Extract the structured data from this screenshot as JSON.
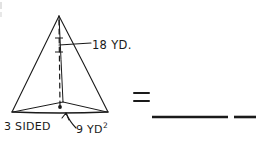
{
  "worksheet": {
    "figure": {
      "shape_name": "triangular-pyramid",
      "height_label": "18 YD.",
      "base_sides_label": "3 SIDED",
      "base_area_label_number": "9 YD",
      "base_area_label_exponent": "2"
    },
    "answer": {
      "equals_sign": "=",
      "blank_long": "",
      "blank_short": ""
    },
    "colors": {
      "ink": "#1a1a1a",
      "paper": "#ffffff"
    }
  }
}
